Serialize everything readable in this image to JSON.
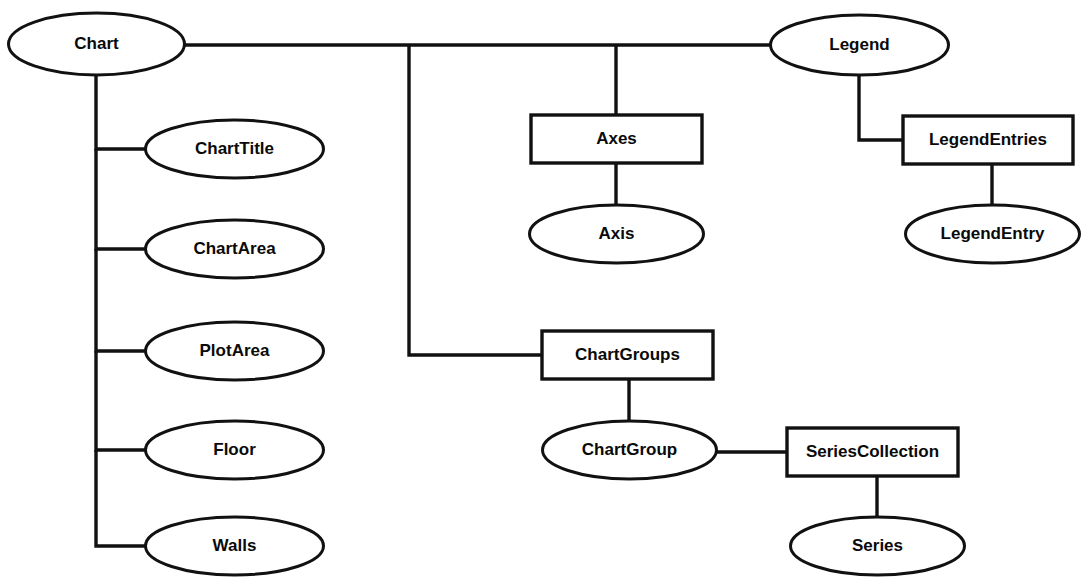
{
  "diagram": {
    "type": "object-model-tree",
    "colors": {
      "background": "#ffffff",
      "stroke": "#111111",
      "text": "#0a0a0a",
      "fill": "#ffffff"
    },
    "nodes": [
      {
        "id": "chart",
        "label": "Chart",
        "shape": "ellipse",
        "cx": 96.5,
        "cy": 44,
        "rx": 88,
        "ry": 31
      },
      {
        "id": "chart-title",
        "label": "ChartTitle",
        "shape": "ellipse",
        "cx": 234.5,
        "cy": 149,
        "rx": 89,
        "ry": 29
      },
      {
        "id": "chart-area",
        "label": "ChartArea",
        "shape": "ellipse",
        "cx": 234.5,
        "cy": 249,
        "rx": 89,
        "ry": 29
      },
      {
        "id": "plot-area",
        "label": "PlotArea",
        "shape": "ellipse",
        "cx": 234.5,
        "cy": 351,
        "rx": 89,
        "ry": 29
      },
      {
        "id": "floor",
        "label": "Floor",
        "shape": "ellipse",
        "cx": 234.5,
        "cy": 450,
        "rx": 89,
        "ry": 29
      },
      {
        "id": "walls",
        "label": "Walls",
        "shape": "ellipse",
        "cx": 234.5,
        "cy": 546,
        "rx": 89,
        "ry": 29
      },
      {
        "id": "axes",
        "label": "Axes",
        "shape": "box",
        "x": 531,
        "y": 115,
        "w": 171,
        "h": 48
      },
      {
        "id": "axis",
        "label": "Axis",
        "shape": "ellipse",
        "cx": 616.5,
        "cy": 234,
        "rx": 87,
        "ry": 29
      },
      {
        "id": "chart-groups",
        "label": "ChartGroups",
        "shape": "box",
        "x": 542,
        "y": 331,
        "w": 171,
        "h": 48
      },
      {
        "id": "chart-group",
        "label": "ChartGroup",
        "shape": "ellipse",
        "cx": 629.5,
        "cy": 450,
        "rx": 87,
        "ry": 29
      },
      {
        "id": "series-collection",
        "label": "SeriesCollection",
        "shape": "box",
        "x": 787,
        "y": 428,
        "w": 171,
        "h": 48
      },
      {
        "id": "series",
        "label": "Series",
        "shape": "ellipse",
        "cx": 877.5,
        "cy": 546,
        "rx": 87,
        "ry": 29
      },
      {
        "id": "legend",
        "label": "Legend",
        "shape": "ellipse",
        "cx": 859.5,
        "cy": 45,
        "rx": 89,
        "ry": 30
      },
      {
        "id": "legend-entries",
        "label": "LegendEntries",
        "shape": "box",
        "x": 903,
        "y": 116,
        "w": 170,
        "h": 48
      },
      {
        "id": "legend-entry",
        "label": "LegendEntry",
        "shape": "ellipse",
        "cx": 992.5,
        "cy": 234,
        "rx": 87,
        "ry": 29
      }
    ],
    "edges": [
      {
        "id": "chart-to-legend",
        "from": "chart",
        "to": "legend",
        "path": "M 184 45 L 770 45"
      },
      {
        "id": "chart-to-chart-title",
        "from": "chart",
        "to": "chart-title",
        "path": "M 96 73 L 96 149 L 146 149"
      },
      {
        "id": "chart-to-chart-area",
        "from": "chart",
        "to": "chart-area",
        "path": "M 96 149 L 96 249 L 146 249"
      },
      {
        "id": "chart-to-plot-area",
        "from": "chart",
        "to": "plot-area",
        "path": "M 96 249 L 96 351 L 146 351"
      },
      {
        "id": "chart-to-floor",
        "from": "chart",
        "to": "floor",
        "path": "M 96 351 L 96 450 L 146 450"
      },
      {
        "id": "chart-to-walls",
        "from": "chart",
        "to": "walls",
        "path": "M 96 450 L 96 546 L 146 546"
      },
      {
        "id": "chart-to-chart-groups",
        "from": "chart",
        "to": "chart-groups",
        "path": "M 409 45 L 409 355 L 542 355"
      },
      {
        "id": "chart-to-axes",
        "from": "chart",
        "to": "axes",
        "path": "M 616 45 L 616 115"
      },
      {
        "id": "axes-to-axis",
        "from": "axes",
        "to": "axis",
        "path": "M 616 163 L 616 205"
      },
      {
        "id": "chart-groups-to-chart-group",
        "from": "chart-groups",
        "to": "chart-group",
        "path": "M 629 379 L 629 421"
      },
      {
        "id": "chart-group-to-series-collection",
        "from": "chart-group",
        "to": "series-collection",
        "path": "M 716 452 L 787 452"
      },
      {
        "id": "series-collection-to-series",
        "from": "series-collection",
        "to": "series",
        "path": "M 877 476 L 877 517"
      },
      {
        "id": "legend-to-legend-entries",
        "from": "legend",
        "to": "legend-entries",
        "path": "M 859 75 L 859 140 L 903 140"
      },
      {
        "id": "legend-entries-to-legend-entry",
        "from": "legend-entries",
        "to": "legend-entry",
        "path": "M 992 164 L 992 205"
      }
    ]
  }
}
